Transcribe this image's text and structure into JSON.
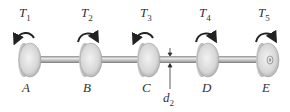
{
  "diagram": {
    "type": "shaft with five gears/disks under torques",
    "shaft_color": "#b9b9b9",
    "disk_color": "#d8d8d8",
    "arrow_color": "#2a2a2a",
    "disks": [
      {
        "id": "A",
        "point_label": "A",
        "torque_symbol": "T",
        "torque_sub": "1",
        "direction": "counterclockwise",
        "x": 27
      },
      {
        "id": "B",
        "point_label": "B",
        "torque_symbol": "T",
        "torque_sub": "2",
        "direction": "clockwise",
        "x": 88
      },
      {
        "id": "C",
        "point_label": "C",
        "torque_symbol": "T",
        "torque_sub": "3",
        "direction": "counterclockwise",
        "x": 146
      },
      {
        "id": "D",
        "point_label": "D",
        "torque_symbol": "T",
        "torque_sub": "4",
        "direction": "clockwise",
        "x": 205
      },
      {
        "id": "E",
        "point_label": "E",
        "torque_symbol": "T",
        "torque_sub": "5",
        "direction": "clockwise",
        "x": 265
      }
    ],
    "dimension": {
      "symbol": "d",
      "sub": "2",
      "description": "shaft diameter between C and D"
    }
  }
}
